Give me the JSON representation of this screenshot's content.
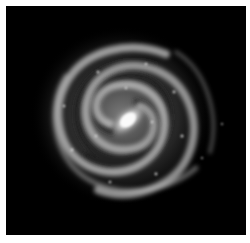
{
  "image": {
    "subject": "spiral galaxy",
    "palette": {
      "background": "#000000",
      "border": "#ffffff",
      "glow": "#9a9a9a",
      "core": "#f4f4f4"
    }
  }
}
